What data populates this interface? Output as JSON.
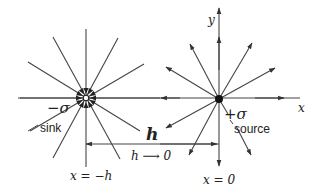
{
  "figure": {
    "colors": {
      "line": "#333333",
      "text": "#222222",
      "background": "#ffffff"
    }
  },
  "labels": {
    "x_axis": "x",
    "y_axis": "y",
    "sink_strength": "−σ",
    "sink": "sink",
    "source_strength": "+σ",
    "source": "source",
    "separation": "h",
    "limit": "h ⟶ 0",
    "sink_position": "x = −h",
    "source_position": "x = 0"
  },
  "elements": {
    "sink": {
      "type": "open-circle",
      "center": [
        86,
        98
      ],
      "ray_direction": "inward",
      "ray_count": 12
    },
    "source": {
      "type": "filled-dot",
      "center": [
        219,
        99
      ],
      "ray_direction": "outward",
      "ray_count": 12
    },
    "separation_arrow": {
      "from": [
        86,
        144
      ],
      "to": [
        219,
        144
      ]
    }
  }
}
